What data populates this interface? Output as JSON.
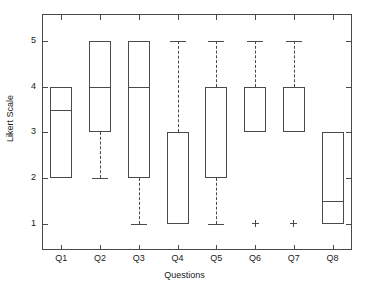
{
  "chart_data": {
    "type": "box",
    "title": "",
    "xlabel": "Questions",
    "ylabel": "Likert Scale",
    "categories": [
      "Q1",
      "Q2",
      "Q3",
      "Q4",
      "Q5",
      "Q6",
      "Q7",
      "Q8"
    ],
    "ytick_labels": [
      "1",
      "2",
      "3",
      "4",
      "5"
    ],
    "ytick_values": [
      1,
      2,
      3,
      4,
      5
    ],
    "ylim": [
      0.42,
      5.6
    ],
    "xlim": [
      0.5,
      8.5
    ],
    "grid": false,
    "legend": null,
    "box_color": "#4a4a4a",
    "background_color": "#ffffff",
    "boxes": [
      {
        "category": "Q1",
        "q1": 2,
        "median": 3.5,
        "q3": 4,
        "whisker_low": null,
        "whisker_high": null,
        "outliers": []
      },
      {
        "category": "Q2",
        "q1": 3,
        "median": 4,
        "q3": 5,
        "whisker_low": 2,
        "whisker_high": null,
        "outliers": []
      },
      {
        "category": "Q3",
        "q1": 2,
        "median": 4,
        "q3": 5,
        "whisker_low": 1,
        "whisker_high": null,
        "outliers": []
      },
      {
        "category": "Q4",
        "q1": 1,
        "median": 3,
        "q3": 3,
        "whisker_low": null,
        "whisker_high": 5,
        "outliers": []
      },
      {
        "category": "Q5",
        "q1": 2,
        "median": 4,
        "q3": 4,
        "whisker_low": 1,
        "whisker_high": 5,
        "outliers": []
      },
      {
        "category": "Q6",
        "q1": 3,
        "median": 4,
        "q3": 4,
        "whisker_low": null,
        "whisker_high": 5,
        "outliers": [
          1
        ]
      },
      {
        "category": "Q7",
        "q1": 3,
        "median": 4,
        "q3": 4,
        "whisker_low": null,
        "whisker_high": 5,
        "outliers": [
          1
        ]
      },
      {
        "category": "Q8",
        "q1": 1,
        "median": 1.5,
        "q3": 3,
        "whisker_low": null,
        "whisker_high": null,
        "outliers": []
      }
    ]
  }
}
